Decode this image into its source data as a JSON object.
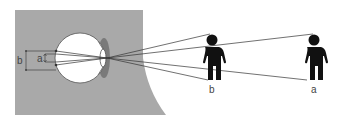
{
  "diagram": {
    "labels": {
      "retina_b": "b",
      "retina_a": "a",
      "person_b": "b",
      "person_a": "a"
    },
    "colors": {
      "head_background": "#a9a9a9",
      "eyeball": "#ffffff",
      "outline": "#555555",
      "rays": "#333333",
      "figure": "#111111",
      "cornea_shadow": "#7a7a7a"
    },
    "figures": [
      {
        "id": "b",
        "position": "near"
      },
      {
        "id": "a",
        "position": "far"
      }
    ]
  }
}
